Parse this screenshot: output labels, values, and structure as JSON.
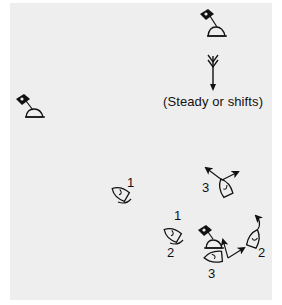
{
  "diagram": {
    "type": "sailing-race-start-diagram",
    "background_color": "#eeeeee",
    "ink_color": "#111111",
    "wind": {
      "icon": "wind-arrow-icon",
      "direction": "down",
      "caption": "(Steady or shifts)"
    },
    "marks": [
      {
        "id": "windward-mark",
        "icon": "flag-buoy-icon",
        "position": "top-right"
      },
      {
        "id": "left-mark",
        "icon": "flag-buoy-icon",
        "position": "middle-left"
      },
      {
        "id": "committee-mark",
        "icon": "flag-buoy-icon",
        "position": "bottom-right"
      }
    ],
    "boats": [
      {
        "label": "1",
        "group": "upper",
        "icon": "boat-icon"
      },
      {
        "label": "3",
        "group": "upper",
        "icon": "boat-icon"
      },
      {
        "label": "1",
        "group": "lower",
        "icon": "boat-icon"
      },
      {
        "label": "2",
        "group": "lower",
        "icon": "boat-icon"
      },
      {
        "label": "3",
        "group": "lower",
        "icon": "boat-icon"
      },
      {
        "label": "2",
        "group": "lower-right",
        "icon": "boat-icon"
      }
    ]
  }
}
